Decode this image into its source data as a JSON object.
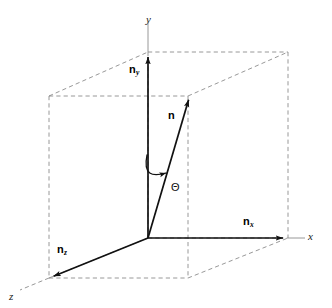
{
  "figure": {
    "kind": "3d-vector-decomposition-diagram",
    "background_color": "#ffffff",
    "solid_color": "#1a1a1a",
    "dashed_color": "#8c8c8c",
    "axis_line_color": "#8c8c8c",
    "width": 332,
    "height": 308
  },
  "axes": [
    {
      "id": "y",
      "label": "y",
      "label_x": 146,
      "label_y": 14,
      "direction": "up"
    },
    {
      "id": "x",
      "label": "x",
      "label_x": 308,
      "label_y": 231,
      "direction": "right"
    },
    {
      "id": "z",
      "label": "z",
      "label_x": 9,
      "label_y": 291,
      "direction": "down-left"
    }
  ],
  "vectors": [
    {
      "id": "n",
      "base": "n",
      "subscript": "",
      "label_x": 168,
      "label_y": 110,
      "from": [
        148,
        238
      ],
      "to": [
        190,
        95
      ],
      "description": "resultant-vector"
    },
    {
      "id": "ny",
      "base": "n",
      "subscript": "y",
      "label_x": 129,
      "label_y": 64,
      "from": [
        148,
        238
      ],
      "to": [
        148,
        52
      ],
      "description": "y-component"
    },
    {
      "id": "nx",
      "base": "n",
      "subscript": "x",
      "label_x": 243,
      "label_y": 216,
      "from": [
        148,
        238
      ],
      "to": [
        288,
        238
      ],
      "description": "x-component"
    },
    {
      "id": "nz",
      "base": "n",
      "subscript": "z",
      "label_x": 57,
      "label_y": 244,
      "from": [
        148,
        238
      ],
      "to": [
        49,
        278
      ],
      "description": "z-component"
    }
  ],
  "angle": {
    "id": "theta",
    "symbol": "Θ",
    "label_x": 171,
    "label_y": 182,
    "description": "rotation-angle-curved-arrow"
  },
  "box": {
    "description": "dashed bounding parallelepiped",
    "style": "dashed",
    "corners": {
      "front_bottom_left": [
        49,
        278
      ],
      "front_bottom_right": [
        188,
        278
      ],
      "front_top_left": [
        49,
        96
      ],
      "front_top_right": [
        188,
        96
      ],
      "back_bottom_left": [
        148,
        238
      ],
      "back_bottom_right": [
        288,
        238
      ],
      "back_top_left": [
        148,
        52
      ],
      "back_top_right": [
        288,
        52
      ]
    }
  }
}
